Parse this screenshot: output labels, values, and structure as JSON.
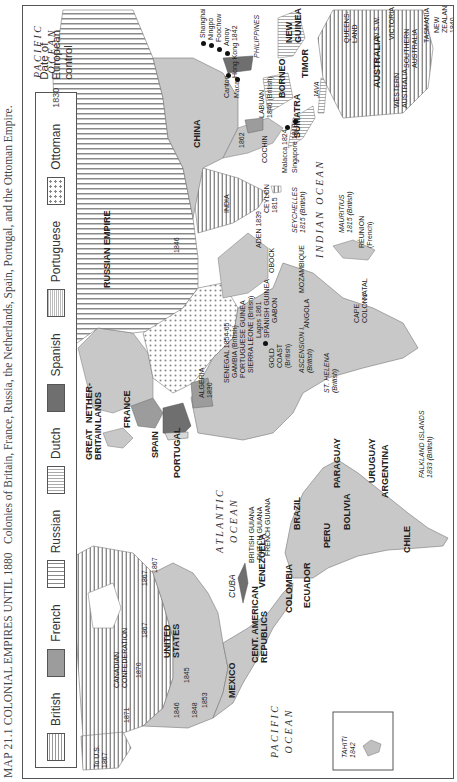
{
  "caption": {
    "map_number": "MAP 21.1",
    "title": "COLONIAL EMPIRES UNTIL 1880",
    "description": "Colonies of Britain, France, Russia, the Netherlands, Spain, Portugal, and the Ottoman Empire."
  },
  "legend": {
    "items": [
      {
        "key": "british",
        "label": "British"
      },
      {
        "key": "french",
        "label": "French"
      },
      {
        "key": "russian",
        "label": "Russian"
      },
      {
        "key": "dutch",
        "label": "Dutch"
      },
      {
        "key": "spanish",
        "label": "Spanish"
      },
      {
        "key": "portuguese",
        "label": "Portuguese"
      },
      {
        "key": "ottoman",
        "label": "Ottoman"
      }
    ],
    "date_sample": "1830",
    "date_label_line1": "Date of European",
    "date_label_line2": "control"
  },
  "oceans": {
    "pacific_east_1": "PACIFIC",
    "pacific_east_2": "OCEAN",
    "pacific_west_1": "PACIFIC",
    "pacific_west_2": "OCEAN",
    "atlantic_1": "ATLANTIC",
    "atlantic_2": "OCEAN",
    "indian": "INDIAN OCEAN"
  },
  "north_america": {
    "to_us": "To U.S.",
    "to_us_year": "1867",
    "canadian_1": "CANADIAN",
    "canadian_2": "CONFEDERATION",
    "dates": [
      "1871",
      "1870",
      "1867",
      "1867",
      "1867",
      "1846",
      "1848",
      "1853",
      "1845"
    ],
    "united_states_1": "UNITED",
    "united_states_2": "STATES",
    "mexico": "MEXICO",
    "cuba": "CUBA",
    "cent_american_1": "CENT. AMERICAN",
    "cent_american_2": "REPUBLICS"
  },
  "south_america": {
    "venezuela": "VENEZUELA",
    "colombia": "COLOMBIA",
    "ecuador": "ECUADOR",
    "peru": "PERU",
    "bolivia": "BOLIVIA",
    "brazil": "BRAZIL",
    "paraguay": "PARAGUAY",
    "uruguay": "URUGUAY",
    "argentina": "ARGENTINA",
    "chile": "CHILE",
    "british_guiana": "BRITISH GUIANA",
    "dutch_guiana": "DUTCH GUIANA",
    "french_guiana": "FRENCH GUIANA",
    "falkland_1": "FALKLAND ISLANDS",
    "falkland_2": "1833 (British)",
    "tahiti": "TAHITI",
    "tahiti_year": "1842"
  },
  "europe": {
    "great_britain_1": "GREAT",
    "great_britain_2": "BRITAIN",
    "netherlands_1": "NETHER-",
    "netherlands_2": "LANDS",
    "france": "FRANCE",
    "spain": "SPAIN",
    "portugal": "PORTUGAL",
    "russian_empire": "RUSSIAN EMPIRE",
    "russia_date": "1846"
  },
  "africa": {
    "algeria": "ALGERIA",
    "algeria_year": "1830",
    "senegal": "SENEGAL 1854-65",
    "gambia": "GAMBIA (British)",
    "portuguese_guinea": "PORTUGUESE GUINEA",
    "sierra_leone": "SIERRA LEONE (British)",
    "lagos": "Lagos 1861",
    "spanish_guinea": "SPANISH GUINEA",
    "gabon": "GABON",
    "gold_coast_1": "GOLD",
    "gold_coast_2": "COAST",
    "gold_coast_3": "(British)",
    "ascension_1": "ASCENSION I.",
    "ascension_2": "(British)",
    "st_helena_1": "ST. HELENA",
    "st_helena_2": "(British)",
    "angola": "ANGOLA",
    "mozambique": "MOZAMBIQUE",
    "cape_colony_1": "CAPE",
    "cape_colony_2": "COLONY",
    "natal": "NATAL",
    "obock": "OBOCK",
    "aden": "ADEN 1839"
  },
  "asia": {
    "china": "CHINA",
    "india": "INDIA",
    "ceylon_1": "CEYLON",
    "ceylon_2": "1815",
    "cochin": "COCHIN",
    "date_1862": "1862",
    "ports": [
      "Shanghai",
      "Ningpo",
      "Foochow",
      "Amoy",
      "Hong Kong 1842",
      "Canton",
      "Macao"
    ],
    "philippines": "PHILIPPINES",
    "labuan_1": "LABUAN",
    "labuan_2": "1846 (British)",
    "borneo": "BORNEO",
    "sumatra": "SUMATRA",
    "java": "JAVA",
    "timor": "TIMOR",
    "new_guinea_1": "NEW",
    "new_guinea_2": "GUINEA",
    "malacca": "Malacca 1824",
    "singapore": "Singapore 1819",
    "seychelles_1": "SEYCHELLES",
    "seychelles_2": "1815 (British)",
    "mauritius_1": "MAURITIUS",
    "mauritius_2": "1815 (British)",
    "reunion_1": "RÉUNION",
    "reunion_2": "(French)"
  },
  "oceania": {
    "australia": "AUSTRALIA",
    "western_1": "WESTERN",
    "western_2": "AUSTRALIA",
    "queensland_1": "QUEENS-",
    "queensland_2": "LAND",
    "nsw": "N.S.W.",
    "victoria": "VICTORIA",
    "southern_1": "SOUTHERN",
    "southern_2": "AUSTRALIA",
    "tasmania": "TASMANIA",
    "new_zealand_1": "NEW",
    "new_zealand_2": "ZEALAND",
    "new_zealand_3": "1840"
  }
}
